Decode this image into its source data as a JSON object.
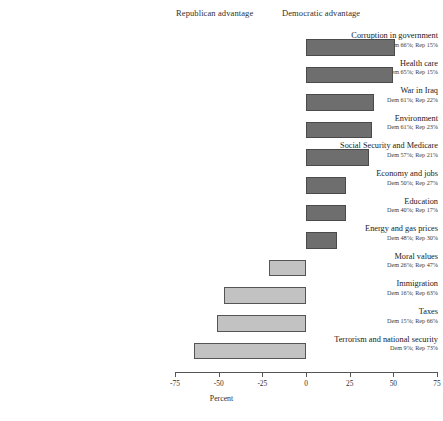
{
  "header": {
    "republican_label": "Republican advantage",
    "democratic_label": "Democratic advantage"
  },
  "axis": {
    "title": "Percent",
    "ticks": [
      "-75",
      "-50",
      "-25",
      "0",
      "25",
      "50",
      "75"
    ]
  },
  "colors": {
    "democratic_bar": "#6e6e6e",
    "republican_bar": "#c2c2c2",
    "bar_border": "#4a4a4a",
    "axis": "#555555",
    "text": "#2b2b2b"
  },
  "chart_data": {
    "type": "bar",
    "title": "",
    "subtitle": "",
    "xlabel": "Percent",
    "ylabel": "",
    "xlim": [
      -75,
      75
    ],
    "grid": false,
    "legend": [
      "Republican advantage",
      "Democratic advantage"
    ],
    "legend_position": "top",
    "orientation": "horizontal",
    "note": "Bar length = Democratic percent minus Republican percent",
    "categories": [
      "Corruption in government",
      "Health care",
      "War in Iraq",
      "Environment",
      "Social Security and Medicare",
      "Economy and jobs",
      "Education",
      "Energy and gas prices",
      "Moral values",
      "Immigration",
      "Taxes",
      "Terrorism and national security"
    ],
    "values": [
      51,
      50,
      39,
      38,
      36,
      23,
      23,
      18,
      -21,
      -47,
      -51,
      -64
    ],
    "series": [
      {
        "name": "Democratic percent",
        "values": [
          66,
          65,
          61,
          61,
          57,
          50,
          40,
          48,
          26,
          16,
          15,
          9
        ]
      },
      {
        "name": "Republican percent",
        "values": [
          15,
          15,
          22,
          23,
          21,
          27,
          17,
          30,
          47,
          63,
          66,
          73
        ]
      }
    ],
    "rows": [
      {
        "name": "Corruption in government",
        "sub": "Dem 66%; Rep 15%",
        "dem": 66,
        "rep": 15,
        "diff": 51,
        "side": "dem"
      },
      {
        "name": "Health care",
        "sub": "Dem 65%; Rep 15%",
        "dem": 65,
        "rep": 15,
        "diff": 50,
        "side": "dem"
      },
      {
        "name": "War in Iraq",
        "sub": "Dem 61%; Rep 22%",
        "dem": 61,
        "rep": 22,
        "diff": 39,
        "side": "dem"
      },
      {
        "name": "Environment",
        "sub": "Dem 61%; Rep 23%",
        "dem": 61,
        "rep": 23,
        "diff": 38,
        "side": "dem"
      },
      {
        "name": "Social Security and Medicare",
        "sub": "Dem 57%; Rep 21%",
        "dem": 57,
        "rep": 21,
        "diff": 36,
        "side": "dem"
      },
      {
        "name": "Economy and jobs",
        "sub": "Dem 50%; Rep 27%",
        "dem": 50,
        "rep": 27,
        "diff": 23,
        "side": "dem"
      },
      {
        "name": "Education",
        "sub": "Dem 40%; Rep 17%",
        "dem": 40,
        "rep": 17,
        "diff": 23,
        "side": "dem"
      },
      {
        "name": "Energy and gas prices",
        "sub": "Dem 48%; Rep 30%",
        "dem": 48,
        "rep": 30,
        "diff": 18,
        "side": "dem"
      },
      {
        "name": "Moral values",
        "sub": "Dem 26%; Rep 47%",
        "dem": 26,
        "rep": 47,
        "diff": -21,
        "side": "rep"
      },
      {
        "name": "Immigration",
        "sub": "Dem 16%; Rep 63%",
        "dem": 16,
        "rep": 63,
        "diff": -47,
        "side": "rep"
      },
      {
        "name": "Taxes",
        "sub": "Dem 15%; Rep 66%",
        "dem": 15,
        "rep": 66,
        "diff": -51,
        "side": "rep"
      },
      {
        "name": "Terrorism and national security",
        "sub": "Dem 9%; Rep 73%",
        "dem": 9,
        "rep": 73,
        "diff": -64,
        "side": "rep"
      }
    ]
  }
}
